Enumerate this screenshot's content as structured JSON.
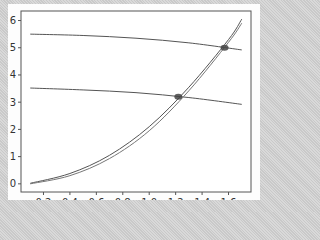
{
  "chart_data": {
    "type": "line",
    "title": "",
    "xlabel": "",
    "ylabel": "",
    "xlim": [
      0.03,
      1.77
    ],
    "ylim": [
      -0.3,
      6.35
    ],
    "grid": false,
    "legend": null,
    "x_ticks": [
      "0.2",
      "0.4",
      "0.6",
      "0.8",
      "1.0",
      "1.2",
      "1.4",
      "1.6"
    ],
    "y_ticks": [
      "0",
      "1",
      "2",
      "3",
      "4",
      "5",
      "6"
    ],
    "series": [
      {
        "name": "upper-flat",
        "x": [
          0.1,
          0.5,
          0.9,
          1.3,
          1.7
        ],
        "y": [
          5.5,
          5.45,
          5.35,
          5.18,
          4.92
        ],
        "color": "#555555"
      },
      {
        "name": "lower-flat",
        "x": [
          0.1,
          0.5,
          0.9,
          1.3,
          1.7
        ],
        "y": [
          3.52,
          3.45,
          3.35,
          3.17,
          2.92
        ],
        "color": "#555555"
      },
      {
        "name": "rising-a",
        "x": [
          0.1,
          0.4,
          0.7,
          1.0,
          1.3,
          1.6,
          1.7
        ],
        "y": [
          0.02,
          0.38,
          1.05,
          2.1,
          3.55,
          5.3,
          6.05
        ],
        "color": "#555555"
      },
      {
        "name": "rising-b",
        "x": [
          0.1,
          0.4,
          0.7,
          1.0,
          1.3,
          1.6,
          1.7
        ],
        "y": [
          0.0,
          0.3,
          0.93,
          1.95,
          3.42,
          5.2,
          5.9
        ],
        "color": "#777777"
      }
    ],
    "markers": [
      {
        "x": 1.22,
        "y": 3.2,
        "color": "#444444"
      },
      {
        "x": 1.57,
        "y": 5.0,
        "color": "#444444"
      }
    ]
  }
}
